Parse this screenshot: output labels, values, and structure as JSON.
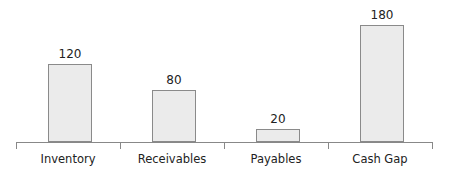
{
  "chart_data": {
    "type": "bar",
    "title": "",
    "xlabel": "",
    "ylabel": "",
    "categories": [
      "Inventory",
      "Receivables",
      "Payables",
      "Cash Gap"
    ],
    "values": [
      120,
      80,
      20,
      180
    ],
    "data_labels": [
      "120",
      "80",
      "20",
      "180"
    ],
    "ylim": [
      0,
      180
    ],
    "grid": false,
    "legend": null,
    "bar_color": "#ebebeb",
    "bar_border_color": "#8a8a8a"
  }
}
